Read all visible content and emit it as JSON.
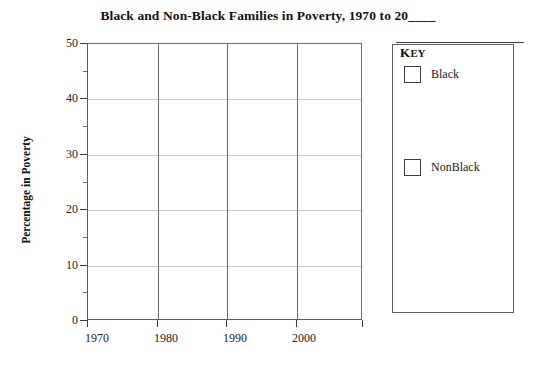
{
  "chart_data": {
    "type": "line",
    "title": "Black and Non-Black Families in Poverty, 1970 to 20____",
    "xlabel": "",
    "ylabel": "Percentage in Poverty",
    "xlim": [
      1970,
      2010
    ],
    "ylim": [
      0,
      50
    ],
    "x_ticks": [
      "1970",
      "1980",
      "1990",
      "2000"
    ],
    "x_tick_values": [
      1970,
      1980,
      1990,
      2000
    ],
    "x_unlabeled_tick_values": [
      2010
    ],
    "y_ticks": [
      "0",
      "10",
      "20",
      "30",
      "40",
      "50"
    ],
    "y_tick_values": [
      0,
      10,
      20,
      30,
      40,
      50
    ],
    "y_minor_tick_values": [
      5,
      15,
      25,
      35,
      45
    ],
    "grid": true,
    "grid_axis": "both",
    "legend_position": "right",
    "legend_title": "Key",
    "series": [
      {
        "name": "Black",
        "values": [],
        "swatch_color": "#ffffff"
      },
      {
        "name": "NonBlack",
        "values": [],
        "swatch_color": "#ffffff"
      }
    ],
    "note": "Blank worksheet grid: no data plotted; title year and series data left to be filled in."
  },
  "colors": {
    "background": "#ffffff",
    "axis_line": "#5a5a5a",
    "major_gridline": "#c9c9c9",
    "vertical_gridline": "#6a6a6a",
    "text": "#1a1a1a",
    "legend_border": "#5f5f5f"
  }
}
